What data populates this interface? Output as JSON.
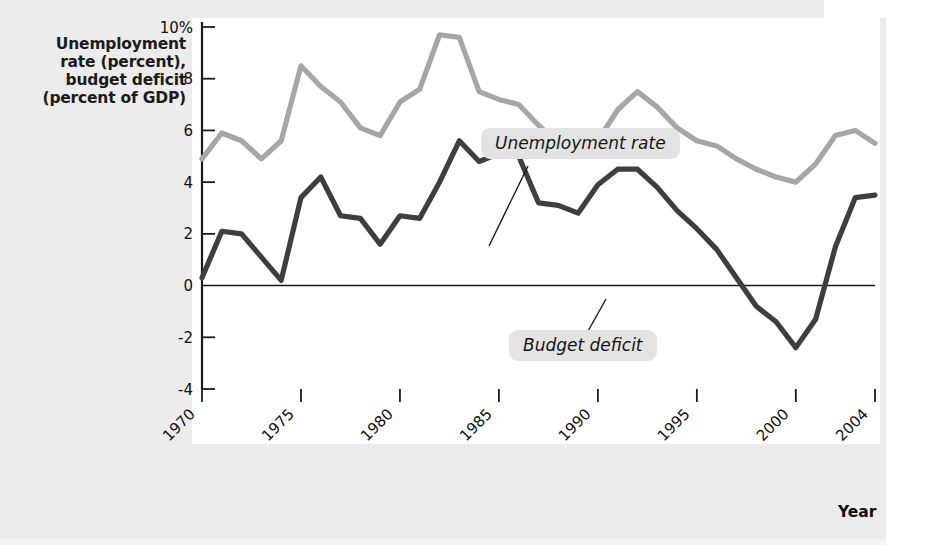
{
  "figure": {
    "y_axis_title": "Unemployment\nrate (percent),\nbudget deficit\n(percent of GDP)",
    "x_axis_title": "Year",
    "callouts": {
      "unemployment": "Unemployment rate",
      "deficit": "Budget deficit"
    },
    "colors": {
      "background": "#ececed",
      "plot_background": "#ffffff",
      "unemployment_line": "#a6a6a6",
      "deficit_line": "#3e3e3e",
      "axis": "#1a1a1a",
      "callout_background": "#e3e3e3"
    }
  },
  "chart_data": {
    "type": "line",
    "title": "",
    "xlabel": "Year",
    "ylabel": "Unemployment rate (percent), budget deficit (percent of GDP)",
    "xlim": [
      1970,
      2004
    ],
    "ylim": [
      -4,
      10
    ],
    "ytick_labels": [
      "10%",
      "8",
      "6",
      "4",
      "2",
      "0",
      "-2",
      "-4"
    ],
    "ytick_values": [
      10,
      8,
      6,
      4,
      2,
      0,
      -2,
      -4
    ],
    "xtick_labels": [
      "1970",
      "1975",
      "1980",
      "1985",
      "1990",
      "1995",
      "2000",
      "2004"
    ],
    "xtick_values": [
      1970,
      1975,
      1980,
      1985,
      1990,
      1995,
      2000,
      2004
    ],
    "grid": false,
    "legend_position": "inline-callouts",
    "x": [
      1970,
      1971,
      1972,
      1973,
      1974,
      1975,
      1976,
      1977,
      1978,
      1979,
      1980,
      1981,
      1982,
      1983,
      1984,
      1985,
      1986,
      1987,
      1988,
      1989,
      1990,
      1991,
      1992,
      1993,
      1994,
      1995,
      1996,
      1997,
      1998,
      1999,
      2000,
      2001,
      2002,
      2003,
      2004
    ],
    "series": [
      {
        "name": "Unemployment rate",
        "color": "#a6a6a6",
        "values": [
          4.9,
          5.9,
          5.6,
          4.9,
          5.6,
          8.5,
          7.7,
          7.1,
          6.1,
          5.8,
          7.1,
          7.6,
          9.7,
          9.6,
          7.5,
          7.2,
          7.0,
          6.2,
          5.5,
          5.3,
          5.6,
          6.8,
          7.5,
          6.9,
          6.1,
          5.6,
          5.4,
          4.9,
          4.5,
          4.2,
          4.0,
          4.7,
          5.8,
          6.0,
          5.5
        ]
      },
      {
        "name": "Budget deficit",
        "color": "#3e3e3e",
        "values": [
          0.3,
          2.1,
          2.0,
          1.1,
          0.2,
          3.4,
          4.2,
          2.7,
          2.6,
          1.6,
          2.7,
          2.6,
          4.0,
          5.6,
          4.8,
          5.1,
          5.0,
          3.2,
          3.1,
          2.8,
          3.9,
          4.5,
          4.5,
          3.8,
          2.9,
          2.2,
          1.4,
          0.3,
          -0.8,
          -1.4,
          -2.4,
          -1.3,
          1.5,
          3.4,
          3.5
        ]
      }
    ]
  }
}
